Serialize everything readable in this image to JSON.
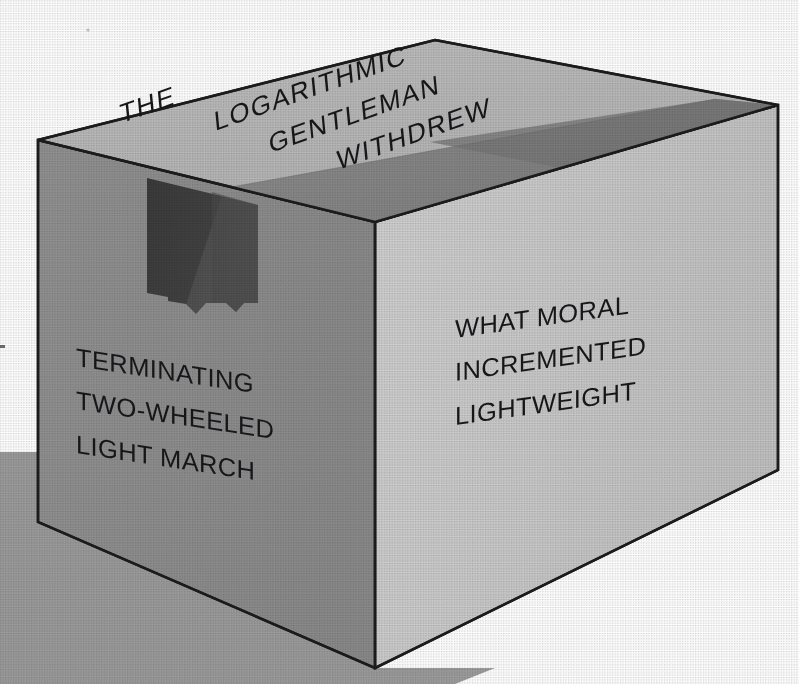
{
  "image": {
    "subject": "open cardboard box in three-quarter perspective",
    "style": "halftone screened print illustration",
    "background_color": "#ffffff"
  },
  "palette": {
    "top_face": "#b6b6b6",
    "top_shadow_band": "#8b8b8b",
    "left_face": "#8d8d8d",
    "right_face": "#c9c9c9",
    "inner_cutout": "#3b3b3b",
    "inner_flap": "#5a5a5a",
    "ground_shadow": "#9c9c9c",
    "outline": "#1c1c1c",
    "text": "#17171a"
  },
  "faces": {
    "top": {
      "name": "top-face",
      "lines": [
        "THE",
        "LOGARITHMIC",
        "GENTLEMAN",
        "WITHDREW"
      ]
    },
    "left": {
      "name": "left-face",
      "lines": [
        "TERMINATING",
        "TWO-WHEELED",
        "LIGHT MARCH"
      ]
    },
    "right": {
      "name": "right-face",
      "lines": [
        "WHAT MORAL",
        "INCREMENTED",
        "LIGHTWEIGHT"
      ]
    }
  },
  "geometry": {
    "top_back_peak": [
      435,
      40
    ],
    "top_left_corner": [
      38,
      140
    ],
    "top_right_corner": [
      778,
      105
    ],
    "front_top_corner": [
      375,
      222
    ],
    "bottom_left_corner": [
      38,
      522
    ],
    "bottom_front_corner": [
      375,
      668
    ],
    "bottom_right_corner": [
      778,
      470
    ]
  }
}
